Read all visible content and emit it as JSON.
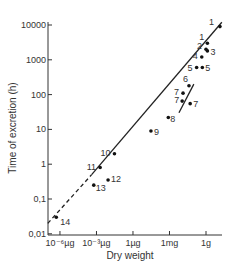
{
  "chart_data": {
    "type": "scatter",
    "title": "",
    "xlabel": "Dry weight",
    "ylabel": "Time of excretion (h)",
    "x_scale": "log",
    "y_scale": "log",
    "x_ticks": [
      {
        "label": "10⁻⁶µg",
        "grams": 1e-12
      },
      {
        "label": "10⁻³µg",
        "grams": 1e-09
      },
      {
        "label": "1µg",
        "grams": 1e-06
      },
      {
        "label": "1mg",
        "grams": 0.001
      },
      {
        "label": "1g",
        "grams": 1
      }
    ],
    "y_ticks": [
      {
        "label": "10000",
        "value": 10000
      },
      {
        "label": "1000",
        "value": 1000
      },
      {
        "label": "100",
        "value": 100
      },
      {
        "label": "10",
        "value": 10
      },
      {
        "label": "1",
        "value": 1
      },
      {
        "label": "0,1",
        "value": 0.1
      },
      {
        "label": "0,01",
        "value": 0.01
      }
    ],
    "xlim_grams": [
      1e-13,
      100
    ],
    "ylim": [
      0.01,
      10000
    ],
    "grid": false,
    "legend": null,
    "points": [
      {
        "label": "1",
        "grams": 14,
        "hours": 9000
      },
      {
        "label": "1",
        "grams": 1.3,
        "hours": 3000
      },
      {
        "label": "2",
        "grams": 1.0,
        "hours": 2000
      },
      {
        "label": "3",
        "grams": 1.3,
        "hours": 1800
      },
      {
        "label": "4",
        "grams": 0.45,
        "hours": 1200
      },
      {
        "label": "5",
        "grams": 0.17,
        "hours": 600
      },
      {
        "label": "5",
        "grams": 0.5,
        "hours": 600
      },
      {
        "label": "6",
        "grams": 0.04,
        "hours": 180
      },
      {
        "label": "7",
        "grams": 0.013,
        "hours": 110
      },
      {
        "label": "7",
        "grams": 0.011,
        "hours": 65
      },
      {
        "label": "7",
        "grams": 0.05,
        "hours": 55
      },
      {
        "label": "8",
        "grams": 0.0008,
        "hours": 22
      },
      {
        "label": "9",
        "grams": 3e-05,
        "hours": 9
      },
      {
        "label": "10",
        "grams": 3e-08,
        "hours": 2
      },
      {
        "label": "11",
        "grams": 2e-09,
        "hours": 0.8
      },
      {
        "label": "12",
        "grams": 9e-09,
        "hours": 0.35
      },
      {
        "label": "13",
        "grams": 6e-10,
        "hours": 0.25
      },
      {
        "label": "14",
        "grams": 5e-13,
        "hours": 0.03
      }
    ],
    "lines": [
      {
        "name": "main-fit-solid",
        "style": "solid",
        "from": {
          "grams": 4e-10,
          "hours": 0.5
        },
        "to": {
          "grams": 20,
          "hours": 12000
        }
      },
      {
        "name": "main-fit-dashed",
        "style": "dashed",
        "from": {
          "grams": 1e-13,
          "hours": 0.02
        },
        "to": {
          "grams": 4e-10,
          "hours": 0.5
        }
      },
      {
        "name": "secondary-fit",
        "style": "solid",
        "from": {
          "grams": 0.006,
          "hours": 30
        },
        "to": {
          "grams": 0.1,
          "hours": 200
        }
      }
    ]
  },
  "pixel_map": {
    "axis_x_px": 48,
    "axis_y_px": 235,
    "x_px_per_decade": 12.17,
    "x_px_at_1g": 206,
    "y_px_per_decade": 34.8,
    "y_px_at_10000": 25
  }
}
